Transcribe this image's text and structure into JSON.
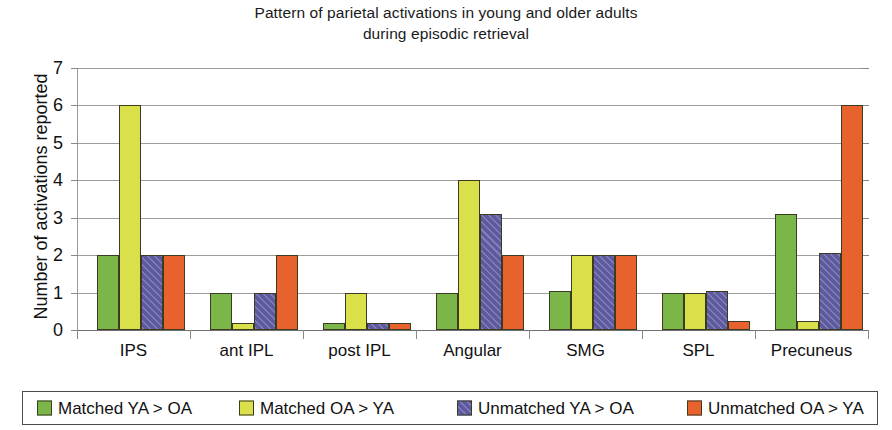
{
  "chart_data": {
    "type": "bar",
    "title": "Pattern of parietal activations in young and older adults during episodic retrieval",
    "title_lines": [
      "Pattern of parietal activations in young and older adults",
      "during episodic retrieval"
    ],
    "xlabel": "",
    "ylabel": "Number of activations reported",
    "ylim": [
      0,
      7
    ],
    "yticks": [
      0,
      1,
      2,
      3,
      4,
      5,
      6,
      7
    ],
    "grid": true,
    "legend_position": "bottom",
    "categories": [
      "IPS",
      "ant IPL",
      "post IPL",
      "Angular",
      "SMG",
      "SPL",
      "Precuneus"
    ],
    "series": [
      {
        "name": "Matched YA > OA",
        "color": "#7ab648",
        "values": [
          2,
          1,
          0.2,
          1,
          1.05,
          1,
          3.1
        ]
      },
      {
        "name": "Matched OA > YA",
        "color": "#d9e04a",
        "values": [
          6,
          0.2,
          1,
          4,
          2,
          1,
          0.25
        ]
      },
      {
        "name": "Unmatched YA > OA",
        "color": "#5d5aa0",
        "values": [
          2,
          1,
          0.2,
          3.1,
          2,
          1.05,
          2.05
        ]
      },
      {
        "name": "Unmatched OA > YA",
        "color": "#e8622e",
        "values": [
          2,
          2,
          0.2,
          2,
          2,
          0.25,
          6
        ]
      }
    ]
  }
}
